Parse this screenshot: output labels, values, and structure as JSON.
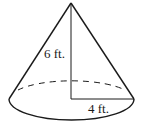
{
  "figure": {
    "shape": "right circular cone",
    "labels": {
      "height": "6 ft.",
      "radius": "4 ft."
    },
    "measurements": {
      "height_ft": 6,
      "radius_ft": 4
    },
    "colors": {
      "stroke": "#1a1a1a",
      "background": "#ffffff"
    }
  }
}
